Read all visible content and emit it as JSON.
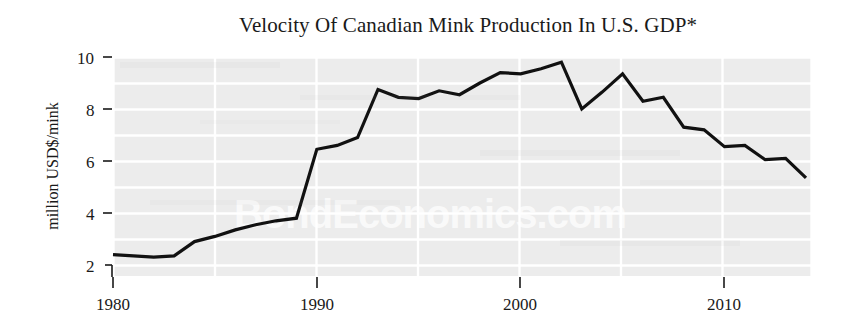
{
  "chart_data": {
    "type": "line",
    "title": "Velocity Of Canadian Mink Production In U.S. GDP*",
    "xlabel": "",
    "ylabel": "million USD$/mink",
    "xlim": [
      1980,
      2014
    ],
    "ylim": [
      2,
      10
    ],
    "xticks": [
      1980,
      1990,
      2000,
      2010
    ],
    "xtick_labels": [
      "1980",
      "1990",
      "2000",
      "2010"
    ],
    "yticks": [
      2,
      4,
      6,
      8,
      10
    ],
    "ytick_labels": [
      "2",
      "4",
      "6",
      "8",
      "10"
    ],
    "grid": true,
    "legend": null,
    "x": [
      1980,
      1981,
      1982,
      1983,
      1984,
      1985,
      1986,
      1987,
      1988,
      1989,
      1990,
      1991,
      1992,
      1993,
      1994,
      1995,
      1996,
      1997,
      1998,
      1999,
      2000,
      2001,
      2002,
      2003,
      2004,
      2005,
      2006,
      2007,
      2008,
      2009,
      2010,
      2011,
      2012,
      2013,
      2014
    ],
    "values": [
      2.4,
      2.35,
      2.3,
      2.35,
      2.9,
      3.1,
      3.35,
      3.55,
      3.7,
      3.8,
      6.45,
      6.6,
      6.9,
      8.75,
      8.45,
      8.4,
      8.7,
      8.55,
      9.0,
      9.4,
      9.35,
      9.55,
      9.8,
      8.0,
      8.65,
      9.35,
      8.3,
      8.45,
      7.3,
      7.2,
      6.55,
      6.6,
      6.05,
      6.1,
      5.35
    ],
    "series": [
      {
        "name": "Velocity of Canadian mink production in U.S. GDP",
        "color": "#111111",
        "values": [
          2.4,
          2.35,
          2.3,
          2.35,
          2.9,
          3.1,
          3.35,
          3.55,
          3.7,
          3.8,
          6.45,
          6.6,
          6.9,
          8.75,
          8.45,
          8.4,
          8.7,
          8.55,
          9.0,
          9.4,
          9.35,
          9.55,
          9.8,
          8.0,
          8.65,
          9.35,
          8.3,
          8.45,
          7.3,
          7.2,
          6.55,
          6.6,
          6.05,
          6.1,
          5.35
        ]
      }
    ],
    "watermark": "BondEconomics.com",
    "colors": {
      "line": "#111111",
      "plot_background": "#ececec",
      "gridlines": "#ffffff",
      "figure_background": "#ffffff",
      "text": "#1a1a1a"
    }
  }
}
